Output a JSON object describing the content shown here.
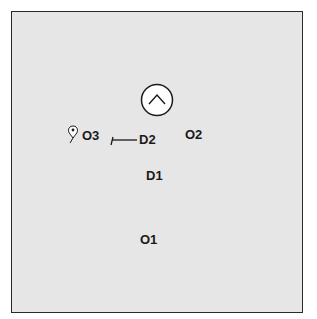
{
  "diagram": {
    "background_color": "#e6e6e6",
    "border_color": "#2a2a2a",
    "labels": {
      "o1": "O1",
      "o2": "O2",
      "o3": "O3",
      "d1": "D1",
      "d2": "D2"
    },
    "icons": {
      "circle_chevron": "chevron-up-in-circle",
      "pin": "map-pin",
      "pointer_line": "leader-line"
    }
  }
}
